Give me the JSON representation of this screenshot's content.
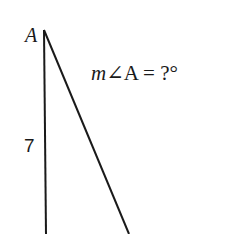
{
  "diagram": {
    "vertex_label": "A",
    "side_label": "7",
    "question": {
      "variable": "m",
      "angle_symbol": "∠",
      "angle_name": "A",
      "equals": "=",
      "unknown": "?°"
    },
    "colors": {
      "stroke": "#1a1a1a",
      "background": "#ffffff"
    }
  }
}
